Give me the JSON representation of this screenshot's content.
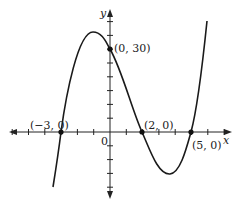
{
  "chart_data": {
    "type": "line",
    "title": "",
    "xlabel": "x",
    "ylabel": "y",
    "function": "f(x) = (x + 3)(x - 2)(x - 5)",
    "origin_label": "0",
    "x_tick_step": 1,
    "y_tick_step": 5,
    "xlim": [
      -6,
      7
    ],
    "ylim": [
      -25,
      45
    ],
    "grid": false,
    "legend": null,
    "points": [
      {
        "x": -3,
        "y": 0,
        "label": "(−3, 0)"
      },
      {
        "x": 0,
        "y": 30,
        "label": "(0, 30)"
      },
      {
        "x": 2,
        "y": 0,
        "label": "(2, 0)"
      },
      {
        "x": 5,
        "y": 0,
        "label": "(5, 0)"
      }
    ],
    "series": [
      {
        "name": "f(x)",
        "x": [
          -3.4,
          -3,
          -2,
          -1.1,
          0,
          1,
          2,
          3,
          3.7,
          4.5,
          5,
          5.4,
          5.9
        ],
        "y": [
          -23,
          0,
          28,
          36,
          30,
          16,
          0,
          -12,
          -15,
          -10,
          0,
          12,
          40
        ]
      }
    ]
  },
  "axes": {
    "x_label": "x",
    "y_label": "y",
    "origin_label": "0"
  }
}
